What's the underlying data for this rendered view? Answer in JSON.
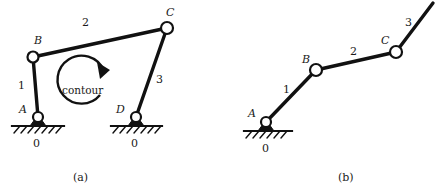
{
  "figure": {
    "type": "kinematic-linkage-diagram",
    "background_color": "#ffffff",
    "stroke_color": "#111111",
    "joint_fill": "#ffffff",
    "width": 436,
    "height": 194
  },
  "captions": {
    "a": "(a)",
    "b": "(b)"
  },
  "diagram_a": {
    "name": "four-bar-closed-loop-mechanism",
    "joints": [
      {
        "id": "A",
        "label": "A",
        "x": 38,
        "y": 117,
        "type": "fixed-pivot",
        "radius": 5
      },
      {
        "id": "B",
        "label": "B",
        "x": 33,
        "y": 57,
        "type": "pin-joint",
        "radius": 5.5
      },
      {
        "id": "C",
        "label": "C",
        "x": 167,
        "y": 28,
        "type": "pin-joint",
        "radius": 6
      },
      {
        "id": "D",
        "label": "D",
        "x": 136,
        "y": 117,
        "type": "fixed-pivot",
        "radius": 5
      }
    ],
    "links": [
      {
        "id": "1",
        "label": "1",
        "from": "A",
        "to": "B",
        "width": 3.4
      },
      {
        "id": "2",
        "label": "2",
        "from": "B",
        "to": "C",
        "width": 3.6
      },
      {
        "id": "3",
        "label": "3",
        "from": "D",
        "to": "C",
        "width": 3.4
      }
    ],
    "link_label_positions": [
      {
        "label": "1",
        "x": 18,
        "y": 80
      },
      {
        "label": "2",
        "x": 82,
        "y": 17
      },
      {
        "label": "3",
        "x": 156,
        "y": 74
      }
    ],
    "point_label_positions": [
      {
        "label": "A",
        "x": 19,
        "y": 104
      },
      {
        "label": "B",
        "x": 34,
        "y": 35
      },
      {
        "label": "C",
        "x": 166,
        "y": 7
      },
      {
        "label": "D",
        "x": 116,
        "y": 104
      }
    ],
    "grounds": [
      {
        "at": "A",
        "label": "0",
        "label_x": 33,
        "label_y": 138,
        "line_x1": 12,
        "line_x2": 64,
        "line_y": 126
      },
      {
        "at": "D",
        "label": "0",
        "label_x": 131,
        "label_y": 138,
        "line_x1": 111,
        "line_x2": 162,
        "line_y": 126
      }
    ],
    "contour": {
      "label": "contour",
      "label_x": 62,
      "label_y": 85,
      "center_x": 84,
      "center_y": 81,
      "radius": 24,
      "direction": "clockwise"
    }
  },
  "diagram_b": {
    "name": "open-kinematic-chain",
    "joints": [
      {
        "id": "A",
        "label": "A",
        "x": 266,
        "y": 122,
        "type": "fixed-pivot",
        "radius": 5
      },
      {
        "id": "B",
        "label": "B",
        "x": 316,
        "y": 70,
        "type": "pin-joint",
        "radius": 6
      },
      {
        "id": "C",
        "label": "C",
        "x": 396,
        "y": 52,
        "type": "pin-joint",
        "radius": 6
      }
    ],
    "links": [
      {
        "id": "1",
        "label": "1",
        "from": "A",
        "to": "B",
        "width": 3.4
      },
      {
        "id": "2",
        "label": "2",
        "from": "B",
        "to": "C",
        "width": 3.4
      },
      {
        "id": "3",
        "label": "3",
        "from": "C",
        "to_free_end_x": 433,
        "to_free_end_y": 3,
        "width": 3.4
      }
    ],
    "link_label_positions": [
      {
        "label": "1",
        "x": 283,
        "y": 84
      },
      {
        "label": "2",
        "x": 350,
        "y": 46
      },
      {
        "label": "3",
        "x": 405,
        "y": 17
      }
    ],
    "point_label_positions": [
      {
        "label": "A",
        "x": 248,
        "y": 108
      },
      {
        "label": "B",
        "x": 302,
        "y": 54
      },
      {
        "label": "C",
        "x": 381,
        "y": 35
      }
    ],
    "grounds": [
      {
        "at": "A",
        "label": "0",
        "label_x": 262,
        "label_y": 143,
        "line_x1": 244,
        "line_x2": 292,
        "line_y": 131
      }
    ]
  }
}
